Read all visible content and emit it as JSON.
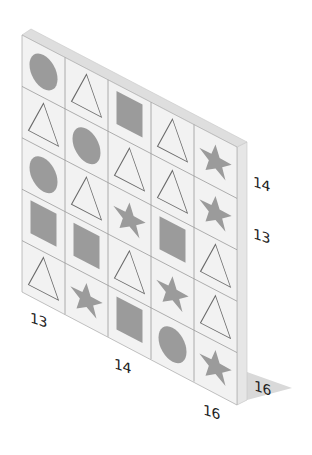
{
  "puzzle": {
    "grid": {
      "columns": 5,
      "rows": 5,
      "cells_by_column": [
        [
          "circle",
          "triangle",
          "circle",
          "square",
          "triangle"
        ],
        [
          "triangle",
          "circle",
          "triangle",
          "square",
          "star"
        ],
        [
          "square",
          "triangle",
          "star",
          "triangle",
          "square"
        ],
        [
          "triangle",
          "triangle",
          "square",
          "star",
          "circle"
        ],
        [
          "star",
          "star",
          "triangle",
          "triangle",
          "star"
        ]
      ]
    },
    "dimension_labels": {
      "right_upper": "14",
      "right_lower": "13",
      "bottom_left": "13",
      "bottom_middle": "14",
      "bottom_right": "16",
      "depth": "16"
    },
    "colors": {
      "panel_face": "#f2f2f2",
      "panel_top": "#dedede",
      "panel_side": "#e6e6e6",
      "grid_line": "#9a9a9a",
      "shape_fill": "#9b9b9b",
      "triangle_stroke": "#6a6a6a",
      "shadow": "#d9d9d9",
      "label_text": "#222222"
    }
  }
}
